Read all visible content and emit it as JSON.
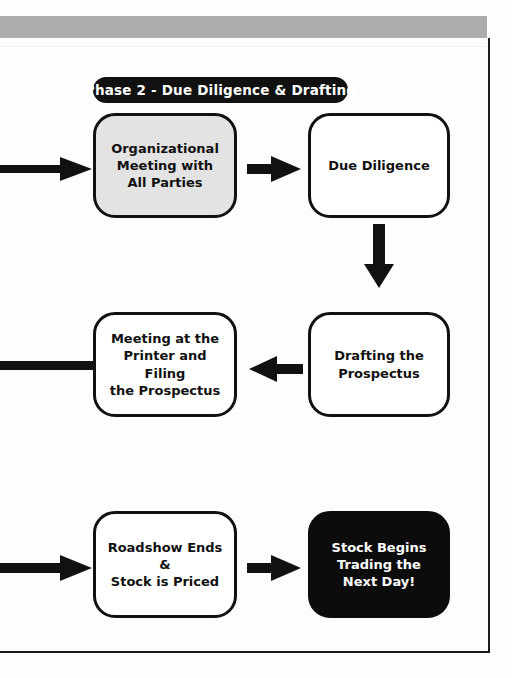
{
  "page": {
    "top_banner_color": "#adadad",
    "border_color": "#1a1a1a",
    "background_color": "#ffffff"
  },
  "phase_banner": {
    "label": "Phase 2  -  Due Diligence & Drafting",
    "background_color": "#111111",
    "text_color": "#ffffff"
  },
  "flowchart": {
    "nodes": [
      {
        "id": "organizational-meeting",
        "label": "Organizational\nMeeting with\nAll Parties",
        "fill": "#e3e3e3",
        "text_color": "#111111"
      },
      {
        "id": "due-diligence",
        "label": "Due Diligence",
        "fill": "#ffffff",
        "text_color": "#111111"
      },
      {
        "id": "meeting-at-printer",
        "label": "Meeting at the\nPrinter and Filing\nthe Prospectus",
        "fill": "#ffffff",
        "text_color": "#111111"
      },
      {
        "id": "drafting-prospectus",
        "label": "Drafting the\nProspectus",
        "fill": "#ffffff",
        "text_color": "#111111"
      },
      {
        "id": "roadshow-ends",
        "label": "Roadshow Ends &\nStock is Priced",
        "fill": "#ffffff",
        "text_color": "#111111"
      },
      {
        "id": "stock-begins-trading",
        "label": "Stock Begins\nTrading the\nNext Day!",
        "fill": "#0c0c0c",
        "text_color": "#ffffff"
      }
    ],
    "connectors": [
      {
        "id": "inbound-top",
        "icon": "arrow-right-icon",
        "direction": "right"
      },
      {
        "id": "org-meeting-to-due-diligence",
        "icon": "arrow-right-icon",
        "direction": "right"
      },
      {
        "id": "due-diligence-to-drafting",
        "icon": "arrow-down-icon",
        "direction": "down"
      },
      {
        "id": "printer-outbound-left",
        "icon": "connector-bar-icon",
        "direction": "left"
      },
      {
        "id": "drafting-to-printer",
        "icon": "arrow-left-icon",
        "direction": "left"
      },
      {
        "id": "inbound-bottom",
        "icon": "arrow-right-icon",
        "direction": "right"
      },
      {
        "id": "roadshow-to-stock-trading",
        "icon": "arrow-right-icon",
        "direction": "right"
      }
    ]
  }
}
